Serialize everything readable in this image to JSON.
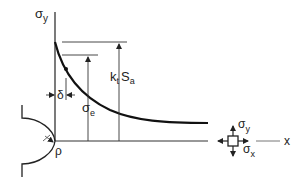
{
  "diagram": {
    "labels": {
      "y_axis": "σ",
      "y_axis_sub": "y",
      "peak_k": "k",
      "peak_k_sub": "t",
      "peak_s": "S",
      "peak_s_sub": "a",
      "sigma_e": "σ",
      "sigma_e_sub": "e",
      "delta": "δ",
      "rho": "ρ",
      "x_axis": "x",
      "elem_sigma_y": "σ",
      "elem_sigma_y_sub": "y",
      "elem_sigma_x": "σ",
      "elem_sigma_x_sub": "x"
    },
    "colors": {
      "line": "#222222",
      "background": "#ffffff"
    }
  }
}
